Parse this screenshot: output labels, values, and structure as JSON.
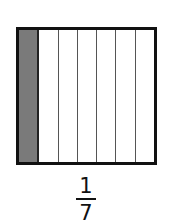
{
  "diagram": {
    "type": "fraction-model",
    "total_parts": 7,
    "shaded_parts": 1,
    "shade_color": "#7a7a7a",
    "parts": [
      {
        "index": 1,
        "shaded": true
      },
      {
        "index": 2,
        "shaded": false
      },
      {
        "index": 3,
        "shaded": false
      },
      {
        "index": 4,
        "shaded": false
      },
      {
        "index": 5,
        "shaded": false
      },
      {
        "index": 6,
        "shaded": false
      },
      {
        "index": 7,
        "shaded": false
      }
    ]
  },
  "fraction": {
    "numerator": "1",
    "denominator": "7"
  }
}
